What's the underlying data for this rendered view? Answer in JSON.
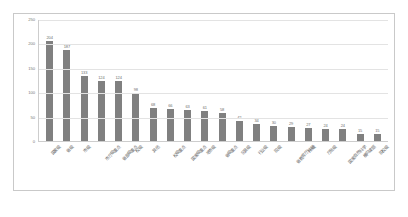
{
  "chart_data": {
    "type": "bar",
    "title": "",
    "subtitle": "",
    "xlabel": "",
    "ylabel": "",
    "ylim": [
      0,
      250
    ],
    "yticks": [
      0,
      50,
      100,
      150,
      200,
      250
    ],
    "grid": true,
    "legend": false,
    "bar_color": "#808080",
    "categories": [
      "国家级",
      "省级",
      "市级",
      "市厅级重点",
      "省部级重点",
      "校级",
      "其他",
      "校级重点",
      "国家级重点",
      "地市级",
      "省级重点",
      "区县级",
      "行业级",
      "院级",
      "省教育厅科研",
      "所级",
      "厅局级",
      "国家自然科学",
      "横向课题",
      "院校级"
    ],
    "values": [
      204,
      187,
      133,
      124,
      124,
      98,
      68,
      66,
      63,
      61,
      58,
      42,
      34,
      30,
      29,
      27,
      24,
      24,
      15,
      15
    ]
  }
}
